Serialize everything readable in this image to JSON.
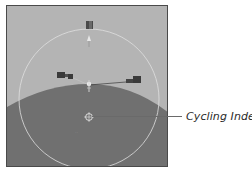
{
  "figure": {
    "callout": {
      "label": "Cycling Index",
      "target": "cycling-index-marker"
    },
    "colors": {
      "sky": "#b4b4b4",
      "ground": "#707070",
      "circle": "#e0e0e0",
      "frame": "#4a4a4a",
      "objects": "#3a3a3a",
      "callout_line": "#6a6a6a",
      "label": "#2a2a2a"
    },
    "icons": [
      "top-object-icon",
      "left-object-icon",
      "right-object-icon",
      "center-gizmo-icon",
      "cycling-index-marker-icon"
    ]
  }
}
